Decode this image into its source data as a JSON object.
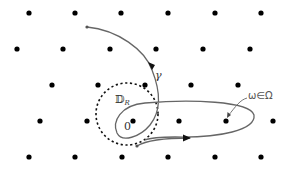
{
  "diagram": {
    "colors": {
      "background": "#ffffff",
      "lattice_point": "#000000",
      "curve": "#666666",
      "disk_boundary": "#111111",
      "label": "#333333"
    },
    "lattice_points": [
      [
        29,
        13
      ],
      [
        75,
        13
      ],
      [
        121,
        13
      ],
      [
        168,
        13
      ],
      [
        215,
        13
      ],
      [
        261,
        13
      ],
      [
        17,
        49
      ],
      [
        63,
        49
      ],
      [
        110,
        49
      ],
      [
        156,
        49
      ],
      [
        203,
        49
      ],
      [
        250,
        49
      ],
      [
        52,
        85
      ],
      [
        98,
        85
      ],
      [
        145,
        85
      ],
      [
        191,
        85
      ],
      [
        238,
        85
      ],
      [
        40,
        121
      ],
      [
        87,
        121
      ],
      [
        133,
        121
      ],
      [
        179,
        121
      ],
      [
        226,
        121
      ],
      [
        273,
        121
      ],
      [
        29,
        157
      ],
      [
        75,
        157
      ],
      [
        122,
        157
      ],
      [
        168,
        157
      ],
      [
        215,
        157
      ],
      [
        261,
        157
      ]
    ],
    "labels": {
      "gamma": "γ",
      "disk": "𝔻",
      "disk_subscript": "R",
      "origin": "0",
      "omega": "ω∈Ω"
    },
    "disk": {
      "cx": 127,
      "cy": 114,
      "r": 31
    }
  }
}
